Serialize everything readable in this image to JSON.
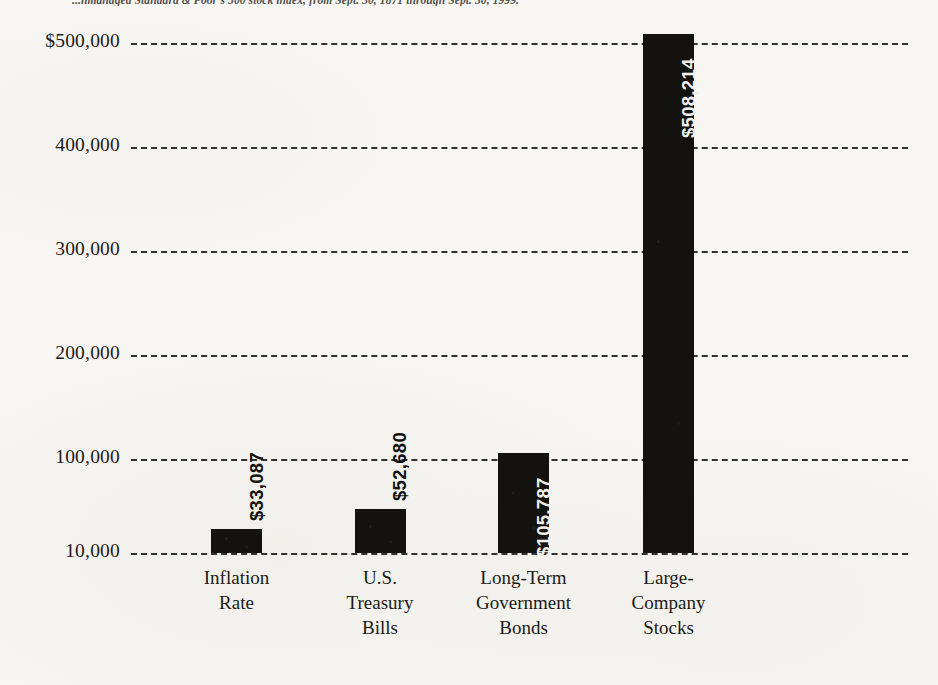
{
  "caption": "...nmanaged Standard & Poor's 500 stock index, from Sept. 30, 1871 through Sept. 30, 1999.",
  "chart_data": {
    "type": "bar",
    "title": "",
    "subtitle": "",
    "xlabel": "",
    "ylabel": "",
    "categories": [
      "Inflation\nRate",
      "U.S.\nTreasury\nBills",
      "Long-Term\nGovernment\nBonds",
      "Large-\nCompany\nStocks"
    ],
    "values": [
      33087,
      52680,
      105787,
      508214
    ],
    "value_labels": [
      "$33,087",
      "$52,680",
      "$105,787",
      "$508,214"
    ],
    "label_placement": [
      "outside",
      "outside",
      "inside",
      "inside"
    ],
    "label_rotation": "vertical",
    "ytick_labels": [
      "$500,000",
      "400,000",
      "300,000",
      "200,000",
      "100,000",
      "10,000"
    ],
    "ytick_values": [
      500000,
      400000,
      300000,
      200000,
      100000,
      10000
    ],
    "ylim": [
      10000,
      500000
    ],
    "grid": true,
    "grid_style": "dashed",
    "legend": "none",
    "bar_color": "#14120f",
    "background_color": "#f7f6f2",
    "text_color": "#1c1a17"
  }
}
